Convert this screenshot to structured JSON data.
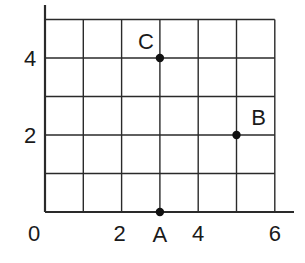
{
  "chart_data": {
    "type": "scatter",
    "title": "",
    "xlabel": "",
    "ylabel": "",
    "xlim": [
      0,
      6
    ],
    "ylim": [
      0,
      5
    ],
    "grid": true,
    "x_ticks": [
      0,
      1,
      2,
      3,
      4,
      5,
      6
    ],
    "y_ticks": [
      0,
      1,
      2,
      3,
      4,
      5
    ],
    "x_tick_labels": [
      {
        "value": 0,
        "label": "0"
      },
      {
        "value": 2,
        "label": "2"
      },
      {
        "value": 4,
        "label": "4"
      },
      {
        "value": 6,
        "label": "6"
      }
    ],
    "y_tick_labels": [
      {
        "value": 2,
        "label": "2"
      },
      {
        "value": 4,
        "label": "4"
      }
    ],
    "points": [
      {
        "label": "A",
        "x": 3,
        "y": 0
      },
      {
        "label": "B",
        "x": 5,
        "y": 2
      },
      {
        "label": "C",
        "x": 3,
        "y": 4
      }
    ],
    "legend": null
  },
  "colors": {
    "line": "#2a2a2a",
    "point": "#111111",
    "background": "#ffffff"
  }
}
